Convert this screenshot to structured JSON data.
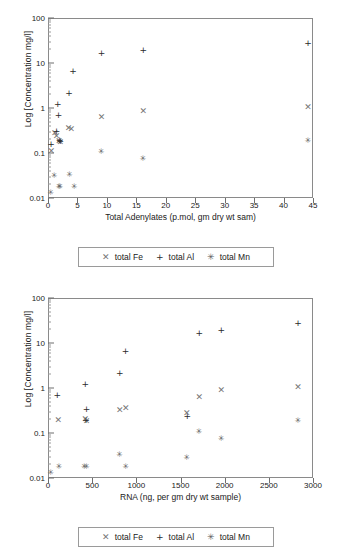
{
  "chart_data": [
    {
      "type": "scatter",
      "title": "",
      "xlabel": "Total Adenylates (p.mol, gm dry wt sam)",
      "ylabel": "Log [Concentration mg/l]",
      "xlim": [
        0,
        45
      ],
      "ylim": [
        0.01,
        100
      ],
      "yscale": "log",
      "grid": false,
      "legend_position": "below",
      "xticks": [
        0,
        5,
        10,
        15,
        20,
        25,
        30,
        35,
        40,
        45
      ],
      "xtick_labels": [
        "0",
        "5",
        "10",
        "15",
        "20",
        "25",
        "30",
        "35",
        "40",
        "45"
      ],
      "yticks": [
        0.01,
        0.1,
        1,
        10,
        100
      ],
      "ytick_labels": [
        "0.01",
        "0.1",
        "1",
        "10",
        "100"
      ],
      "series": [
        {
          "name": "total Fe",
          "marker": "x-marker",
          "color": "#767676",
          "points": [
            [
              0.4,
              0.115
            ],
            [
              1.0,
              0.3
            ],
            [
              1.3,
              0.25
            ],
            [
              1.7,
              0.195
            ],
            [
              1.9,
              0.185
            ],
            [
              3.3,
              0.375
            ],
            [
              3.8,
              0.355
            ],
            [
              8.9,
              0.66
            ],
            [
              16.0,
              0.92
            ],
            [
              44.0,
              1.08
            ]
          ]
        },
        {
          "name": "total Al",
          "marker": "plus-marker",
          "color": "#2b2b2b",
          "points": [
            [
              0.35,
              0.165
            ],
            [
              1.3,
              0.33
            ],
            [
              1.5,
              1.3
            ],
            [
              1.6,
              0.72
            ],
            [
              1.8,
              0.2
            ],
            [
              1.9,
              0.19
            ],
            [
              3.4,
              2.25
            ],
            [
              4.1,
              7.0
            ],
            [
              8.9,
              17.5
            ],
            [
              16.0,
              21.0
            ],
            [
              44.0,
              29.0
            ]
          ]
        },
        {
          "name": "total Mn",
          "marker": "asterisk-marker",
          "color": "#5e5e5e",
          "points": [
            [
              0.3,
              0.0135
            ],
            [
              0.9,
              0.033
            ],
            [
              1.7,
              0.0185
            ],
            [
              1.9,
              0.0185
            ],
            [
              3.5,
              0.035
            ],
            [
              4.3,
              0.0185
            ],
            [
              8.9,
              0.108
            ],
            [
              16.0,
              0.078
            ],
            [
              44.0,
              0.19
            ]
          ]
        }
      ],
      "legend": [
        {
          "label": "total Fe",
          "symbol": "x-marker"
        },
        {
          "label": "total Al",
          "symbol": "plus-marker"
        },
        {
          "label": "total Mn",
          "symbol": "asterisk-marker"
        }
      ]
    },
    {
      "type": "scatter",
      "title": "",
      "xlabel": "RNA (ng, per gm dry wt sample)",
      "ylabel": "Log [Concentration mg/l]",
      "xlim": [
        0,
        3000
      ],
      "ylim": [
        0.01,
        100
      ],
      "yscale": "log",
      "grid": false,
      "legend_position": "below",
      "xticks": [
        0,
        500,
        1000,
        1500,
        2000,
        2500,
        3000
      ],
      "xtick_labels": [
        "0",
        "500",
        "1000",
        "1500",
        "2000",
        "2500",
        "3000"
      ],
      "yticks": [
        0.01,
        0.1,
        1,
        10,
        100
      ],
      "ytick_labels": [
        "0.01",
        "0.1",
        "1",
        "10",
        "100"
      ],
      "series": [
        {
          "name": "total Fe",
          "marker": "x-marker",
          "color": "#767676",
          "points": [
            [
              105,
              0.205
            ],
            [
              410,
              0.215
            ],
            [
              425,
              0.19
            ],
            [
              800,
              0.345
            ],
            [
              870,
              0.375
            ],
            [
              1560,
              0.3
            ],
            [
              1700,
              0.665
            ],
            [
              1950,
              0.97
            ],
            [
              2820,
              1.12
            ]
          ]
        },
        {
          "name": "total Al",
          "marker": "plus-marker",
          "color": "#2b2b2b",
          "points": [
            [
              95,
              0.75
            ],
            [
              410,
              1.3
            ],
            [
              425,
              0.36
            ],
            [
              420,
              0.2
            ],
            [
              800,
              2.25
            ],
            [
              865,
              7.0
            ],
            [
              1565,
              0.25
            ],
            [
              1700,
              17.5
            ],
            [
              1950,
              21.0
            ],
            [
              2820,
              29.0
            ]
          ]
        },
        {
          "name": "total Mn",
          "marker": "asterisk-marker",
          "color": "#5e5e5e",
          "points": [
            [
              20,
              0.0135
            ],
            [
              115,
              0.0185
            ],
            [
              400,
              0.0185
            ],
            [
              425,
              0.0185
            ],
            [
              800,
              0.035
            ],
            [
              870,
              0.0185
            ],
            [
              1560,
              0.03
            ],
            [
              1700,
              0.108
            ],
            [
              1950,
              0.078
            ],
            [
              2820,
              0.195
            ]
          ]
        }
      ],
      "legend": [
        {
          "label": "total Fe",
          "symbol": "x-marker"
        },
        {
          "label": "total Al",
          "symbol": "plus-marker"
        },
        {
          "label": "total Mn",
          "symbol": "asterisk-marker"
        }
      ]
    }
  ],
  "symbols": {
    "x-marker": "✕",
    "plus-marker": "+",
    "asterisk-marker": "✳"
  }
}
